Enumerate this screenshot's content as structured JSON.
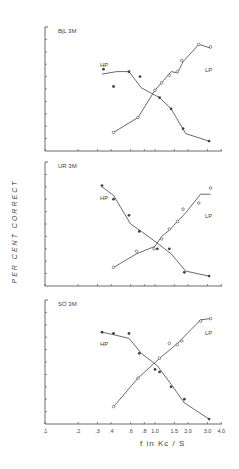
{
  "chart_data": {
    "type": "line",
    "shared_ylabel": "PER CENT CORRECT",
    "shared_xlabel": "f in Kc / S",
    "xscale": "log",
    "xlim": [
      0.1,
      4.0
    ],
    "ylim": [
      0,
      100
    ],
    "xticks": [
      ".1",
      ".2",
      ".3",
      ".4",
      ".6",
      ".8",
      "1.0",
      "1.5",
      "2.0",
      "3.0",
      "4.0"
    ],
    "xtick_values": [
      0.1,
      0.2,
      0.3,
      0.4,
      0.6,
      0.8,
      1.0,
      1.5,
      2.0,
      3.0,
      4.0
    ],
    "y_ticks_count": 10,
    "panels": [
      {
        "title": "BjL   3M",
        "series": [
          {
            "name": "HP",
            "marker": "filled",
            "x": [
              0.34,
              0.42,
              0.58,
              0.73,
              1.1,
              1.4,
              1.8,
              3.1
            ],
            "y": [
              66,
              52,
              64,
              60,
              43,
              34,
              18,
              8
            ],
            "line": [
              [
                0.33,
                62
              ],
              [
                0.45,
                64
              ],
              [
                0.58,
                64
              ],
              [
                0.75,
                51
              ],
              [
                1.1,
                43
              ],
              [
                1.4,
                34
              ],
              [
                1.9,
                14
              ],
              [
                3.1,
                8
              ]
            ]
          },
          {
            "name": "LP",
            "marker": "open",
            "x": [
              0.42,
              0.7,
              1.0,
              1.15,
              1.35,
              1.6,
              1.75,
              2.5,
              3.2
            ],
            "y": [
              15,
              27,
              49,
              55,
              61,
              64,
              73,
              86,
              84
            ],
            "line": [
              [
                0.42,
                15
              ],
              [
                0.7,
                27
              ],
              [
                1.0,
                49
              ],
              [
                1.2,
                57
              ],
              [
                1.4,
                64
              ],
              [
                1.6,
                63
              ],
              [
                1.8,
                72
              ],
              [
                2.5,
                86
              ],
              [
                3.2,
                83
              ]
            ]
          }
        ]
      },
      {
        "title": "UR   3M",
        "series": [
          {
            "name": "HP",
            "marker": "filled",
            "x": [
              0.33,
              0.42,
              0.58,
              0.72,
              1.05,
              1.35,
              1.85,
              3.1
            ],
            "y": [
              81,
              70,
              57,
              44,
              30,
              30,
              11,
              8
            ],
            "line": [
              [
                0.33,
                80
              ],
              [
                0.42,
                73
              ],
              [
                0.6,
                50
              ],
              [
                0.75,
                44
              ],
              [
                1.0,
                36
              ],
              [
                1.4,
                26
              ],
              [
                1.9,
                12
              ],
              [
                3.1,
                8
              ]
            ]
          },
          {
            "name": "LP",
            "marker": "open",
            "x": [
              0.42,
              0.68,
              0.98,
              1.15,
              1.35,
              1.6,
              1.8,
              2.5,
              3.2
            ],
            "y": [
              15,
              28,
              30,
              38,
              46,
              52,
              62,
              67,
              79
            ],
            "line": [
              [
                0.42,
                15
              ],
              [
                0.68,
                26
              ],
              [
                1.0,
                32
              ],
              [
                1.15,
                40
              ],
              [
                1.35,
                45
              ],
              [
                1.6,
                52
              ],
              [
                1.9,
                59
              ],
              [
                2.6,
                74
              ],
              [
                3.2,
                74
              ]
            ]
          }
        ]
      },
      {
        "title": "SÖ   3M",
        "series": [
          {
            "name": "HP",
            "marker": "filled",
            "x": [
              0.33,
              0.42,
              0.58,
              0.72,
              1.0,
              1.1,
              1.4,
              1.85,
              3.1
            ],
            "y": [
              74,
              73,
              73,
              57,
              44,
              42,
              30,
              20,
              4
            ],
            "line": [
              [
                0.33,
                74
              ],
              [
                0.42,
                72
              ],
              [
                0.58,
                69
              ],
              [
                0.75,
                57
              ],
              [
                1.05,
                47
              ],
              [
                1.4,
                32
              ],
              [
                1.85,
                17
              ],
              [
                3.1,
                4
              ]
            ]
          },
          {
            "name": "LP",
            "marker": "open",
            "x": [
              0.42,
              0.7,
              1.1,
              1.35,
              1.6,
              1.75,
              2.6,
              3.2
            ],
            "y": [
              14,
              37,
              53,
              65,
              64,
              67,
              83,
              85
            ],
            "line": [
              [
                0.42,
                14
              ],
              [
                0.7,
                37
              ],
              [
                1.1,
                53
              ],
              [
                1.6,
                65
              ],
              [
                2.6,
                84
              ],
              [
                3.2,
                85
              ]
            ]
          }
        ]
      }
    ]
  },
  "labels": {
    "ylabel": "PER CENT CORRECT",
    "xlabel": "f in Kc / S",
    "panel_titles": [
      "BjL   3M",
      "UR   3M",
      "SÖ   3M"
    ],
    "series_labels": [
      "HP",
      "LP"
    ]
  },
  "colors": {
    "ink": "#444444",
    "background": "#ffffff"
  }
}
